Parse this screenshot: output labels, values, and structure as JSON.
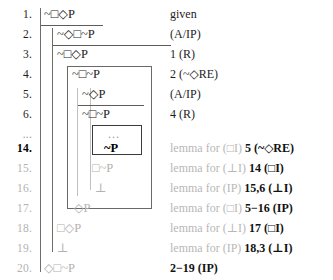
{
  "document": {
    "kind": "fitch-style-natural-deduction-proof",
    "logic": "modal-logic",
    "ellipsis": "..."
  },
  "rows": [
    {
      "number": "1.",
      "formula": "~□◇P",
      "justification": "given",
      "just_lead": "",
      "just_tail": "given",
      "depth": 0,
      "tone": "black",
      "number_tone": "black",
      "highlight": false
    },
    {
      "number": "2.",
      "formula": "~◇□~P",
      "justification": "(A/IP)",
      "just_lead": "",
      "just_tail": "(A/IP)",
      "depth": 1,
      "tone": "black",
      "number_tone": "black",
      "highlight": false
    },
    {
      "number": "3.",
      "formula": "~□◇P",
      "justification": "1 (R)",
      "just_lead": "",
      "just_tail": "1 (R)",
      "depth": 1,
      "tone": "black",
      "number_tone": "black",
      "highlight": false
    },
    {
      "number": "4.",
      "formula": "~□~P",
      "justification": "2 (~◇RE)",
      "just_lead": "",
      "just_tail": "2 (~◇RE)",
      "depth": 2,
      "tone": "black",
      "number_tone": "black",
      "highlight": false
    },
    {
      "number": "5.",
      "formula": "~◇P",
      "justification": "(A/IP)",
      "just_lead": "",
      "just_tail": "(A/IP)",
      "depth": 3,
      "tone": "black",
      "number_tone": "black",
      "highlight": false
    },
    {
      "number": "6.",
      "formula": "~□~P",
      "justification": "4 (R)",
      "just_lead": "",
      "just_tail": "4 (R)",
      "depth": 3,
      "tone": "black",
      "number_tone": "black",
      "highlight": false
    },
    {
      "number": "...",
      "formula": "...",
      "justification": "",
      "just_lead": "",
      "just_tail": "",
      "depth": 4,
      "tone": "mid",
      "number_tone": "mid",
      "highlight": false
    },
    {
      "number": "14.",
      "formula": "~P",
      "justification": "lemma for (□I) 5 (~◇RE)",
      "just_lead": "lemma for (□I)",
      "just_tail": "5 (~◇RE)",
      "depth": 4,
      "tone": "bold",
      "number_tone": "bold",
      "highlight": true
    },
    {
      "number": "15.",
      "formula": "□~P",
      "justification": "lemma for (⊥I) 14 (□I)",
      "just_lead": "lemma for (⊥I)",
      "just_tail": "14 (□I)",
      "depth": 3,
      "tone": "gray",
      "number_tone": "gray",
      "highlight": false
    },
    {
      "number": "16.",
      "formula": "⊥",
      "justification": "lemma for (IP) 15,6 (⊥I)",
      "just_lead": "lemma for (IP)",
      "just_tail": "15,6 (⊥I)",
      "depth": 3,
      "tone": "gray",
      "number_tone": "gray",
      "highlight": false
    },
    {
      "number": "17.",
      "formula": "◇P",
      "justification": "lemma for (□I) 5−16 (IP)",
      "just_lead": "lemma for (□I)",
      "just_tail": "5−16 (IP)",
      "depth": 2,
      "tone": "gray",
      "number_tone": "gray",
      "highlight": false
    },
    {
      "number": "18.",
      "formula": "□◇P",
      "justification": "lemma for (⊥I) 17 (□I)",
      "just_lead": "lemma for (⊥I)",
      "just_tail": "17 (□I)",
      "depth": 1,
      "tone": "gray",
      "number_tone": "gray",
      "highlight": false
    },
    {
      "number": "19.",
      "formula": "⊥",
      "justification": "lemma for (IP) 18,3 (⊥I)",
      "just_lead": "lemma for (IP)",
      "just_tail": "18,3 (⊥I)",
      "depth": 1,
      "tone": "gray",
      "number_tone": "gray",
      "highlight": false
    },
    {
      "number": "20.",
      "formula": "◇□~P",
      "justification": "2−19 (IP)",
      "just_lead": "",
      "just_tail": "2−19 (IP)",
      "depth": 0,
      "tone": "gray",
      "number_tone": "gray",
      "highlight": false
    }
  ],
  "structure": {
    "scope_lines": [
      {
        "name": "scope-line-outer",
        "note": "main derivation, lines 1-20"
      },
      {
        "name": "scope-line-ip-1",
        "note": "indirect proof subproof, lines 2-19"
      },
      {
        "name": "scope-line-box-1",
        "note": "strict subproof, lines 4-17"
      },
      {
        "name": "scope-line-ip-2",
        "note": "indirect proof subproof, lines 5-16"
      },
      {
        "name": "scope-line-box-2",
        "note": "strict subproof, lines 14"
      }
    ],
    "assumption_bars": [
      {
        "name": "assumption-bar-line-1"
      },
      {
        "name": "assumption-bar-line-2"
      },
      {
        "name": "assumption-bar-line-5"
      }
    ],
    "highlight_boxes": [
      {
        "name": "highlight-box-outer",
        "note": "encloses lines 4 through 17"
      },
      {
        "name": "highlight-box-inner",
        "note": "encloses ellipsis and line 14"
      }
    ]
  },
  "colors": {
    "ink": "#1d1d1d",
    "faded": "#b4b2b0",
    "rule": "#6f6d6b",
    "background": "#ffffff"
  }
}
